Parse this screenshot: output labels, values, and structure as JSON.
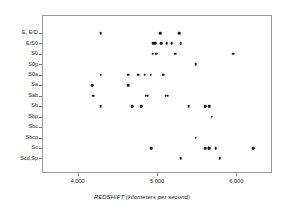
{
  "chart_data": {
    "type": "scatter",
    "title": "",
    "xlabel": "REDSHIFT (kilometers per second)",
    "ylabel": "",
    "xlim": [
      3550,
      6450
    ],
    "xticks": [
      4000,
      5000,
      6000
    ],
    "xticklabels": [
      "4,000",
      "5,000",
      "6,000"
    ],
    "grid": false,
    "legend": null,
    "categories": [
      "E, E/D",
      "E/S0",
      "S0",
      "S0p",
      "S0a",
      "Sa",
      "Sab",
      "Sb",
      "Sbp",
      "Sbc",
      "Sbcp",
      "Sc",
      "Scd,Sp"
    ],
    "points": [
      {
        "category": "E, E/D",
        "redshift": 4290
      },
      {
        "category": "E, E/D",
        "redshift": 5040
      },
      {
        "category": "E, E/D",
        "redshift": 5280
      },
      {
        "category": "E/S0",
        "redshift": 4955
      },
      {
        "category": "E/S0",
        "redshift": 4975
      },
      {
        "category": "E/S0",
        "redshift": 5055
      },
      {
        "category": "E/S0",
        "redshift": 5120
      },
      {
        "category": "E/S0",
        "redshift": 5185
      },
      {
        "category": "E/S0",
        "redshift": 5300
      },
      {
        "category": "S0",
        "redshift": 4945
      },
      {
        "category": "S0",
        "redshift": 4990
      },
      {
        "category": "S0",
        "redshift": 5230
      },
      {
        "category": "S0",
        "redshift": 5960
      },
      {
        "category": "S0p",
        "redshift": 5490
      },
      {
        "category": "S0a",
        "redshift": 4290
      },
      {
        "category": "S0a",
        "redshift": 4635
      },
      {
        "category": "S0a",
        "redshift": 4765
      },
      {
        "category": "S0a",
        "redshift": 4845
      },
      {
        "category": "S0a",
        "redshift": 4920
      },
      {
        "category": "S0a",
        "redshift": 5080
      },
      {
        "category": "Sa",
        "redshift": 4185
      },
      {
        "category": "Sa",
        "redshift": 4640
      },
      {
        "category": "Sab",
        "redshift": 4195
      },
      {
        "category": "Sab",
        "redshift": 4860
      },
      {
        "category": "Sab",
        "redshift": 4885
      },
      {
        "category": "Sab",
        "redshift": 5110
      },
      {
        "category": "Sab",
        "redshift": 5135
      },
      {
        "category": "Sb",
        "redshift": 4290
      },
      {
        "category": "Sb",
        "redshift": 4690
      },
      {
        "category": "Sb",
        "redshift": 4800
      },
      {
        "category": "Sb",
        "redshift": 5400
      },
      {
        "category": "Sb",
        "redshift": 5610
      },
      {
        "category": "Sb",
        "redshift": 5660
      },
      {
        "category": "Sbp",
        "redshift": 5690
      },
      {
        "category": "Sbcp",
        "redshift": 5490
      },
      {
        "category": "Sc",
        "redshift": 4930
      },
      {
        "category": "Sc",
        "redshift": 5605
      },
      {
        "category": "Sc",
        "redshift": 5650
      },
      {
        "category": "Sc",
        "redshift": 5660
      },
      {
        "category": "Sc",
        "redshift": 5740
      },
      {
        "category": "Sc",
        "redshift": 6215
      },
      {
        "category": "Scd,Sp",
        "redshift": 5300
      },
      {
        "category": "Scd,Sp",
        "redshift": 5790
      }
    ]
  }
}
